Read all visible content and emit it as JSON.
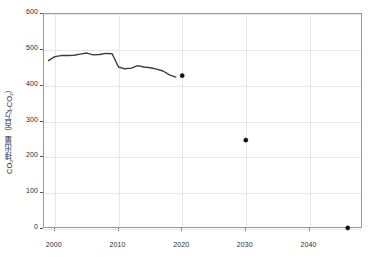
{
  "chart_data": {
    "type": "line",
    "title": "",
    "xlabel": "",
    "ylabel": "CO₂排出量（百万t-CO₂）",
    "xlim": [
      1998.3,
      2048.4
    ],
    "ylim": [
      0,
      600
    ],
    "xticks": [
      2000,
      2010,
      2020,
      2030,
      2040
    ],
    "xtick_labels": [
      "2000",
      "2010",
      "2020",
      "2030",
      "2040"
    ],
    "yticks": [
      0,
      100,
      200,
      300,
      400,
      500,
      600
    ],
    "ytick_labels": [
      "0",
      "100",
      "200",
      "300",
      "400",
      "500",
      "600"
    ],
    "grid": true,
    "legend": "none",
    "series": [
      {
        "name": "historical",
        "style": "line",
        "x": [
          1999,
          2000,
          2001,
          2002,
          2003,
          2004,
          2005,
          2006,
          2007,
          2008,
          2009,
          2010,
          2011,
          2012,
          2013,
          2014,
          2015,
          2016,
          2017,
          2018,
          2019
        ],
        "values": [
          470,
          481,
          484,
          484,
          485,
          488,
          491,
          486,
          487,
          490,
          489,
          452,
          447,
          449,
          456,
          452,
          450,
          446,
          441,
          430,
          424
        ]
      },
      {
        "name": "targets",
        "style": "marker",
        "x": [
          2020,
          2030,
          2046
        ],
        "values": [
          428,
          248,
          3
        ]
      }
    ]
  },
  "axes": {
    "ylabel_text": "CO₂排出量（百万t-CO₂）"
  },
  "colors": {
    "line": "#3a3a3a",
    "marker": "#111111",
    "grid": "#e8e8ec",
    "frame": "#9a9a9a",
    "text": "#2b2b2b",
    "background": "#ffffff"
  }
}
